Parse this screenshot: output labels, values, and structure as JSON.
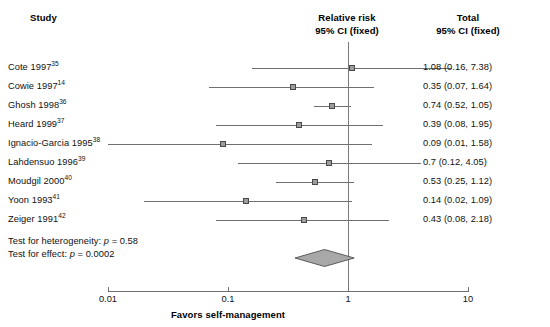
{
  "figure": {
    "type": "forest-plot",
    "headers": {
      "study": "Study",
      "center_line1": "Relative risk",
      "center_line2": "95% CI (fixed)",
      "total_line1": "Total",
      "total_line2": "95% CI (fixed)"
    },
    "axis": {
      "scale": "log",
      "ticks": [
        "0.01",
        "0.1",
        "1",
        "10"
      ],
      "tick_values": [
        0.01,
        0.1,
        1,
        10
      ],
      "null_value": 1,
      "title": "Favors self-management"
    },
    "tests": {
      "heterogeneity": "Test for heterogeneity: p = 0.58",
      "effect": "Test for effect: p = 0.0002"
    },
    "colors": {
      "line": "#6f6f6f",
      "box_fill": "#9c9c9c",
      "box_edge": "#4a4a4a",
      "diamond_fill": "#a8a8a8",
      "diamond_edge": "#5a5a5a",
      "text": "#111111",
      "background": "#ffffff"
    }
  },
  "chart_data": {
    "type": "forest",
    "title": "",
    "xlabel": "Favors self-management",
    "ylabel": "",
    "xscale": "log",
    "xlim": [
      0.01,
      10
    ],
    "xticks": [
      0.01,
      0.1,
      1,
      10
    ],
    "xticklabels": [
      "0.01",
      "0.1",
      "1",
      "10"
    ],
    "null_line": 1,
    "effect_measure": "Relative risk",
    "ci_level": "95% CI (fixed)",
    "grid": false,
    "legend": "none",
    "rows": [
      {
        "study": "Cote 1997",
        "ref": "35",
        "estimate": 1.08,
        "lower": 0.16,
        "upper": 7.38,
        "label": "1.08 (0.16, 7.38)"
      },
      {
        "study": "Cowie 1997",
        "ref": "14",
        "estimate": 0.35,
        "lower": 0.07,
        "upper": 1.64,
        "label": "0.35 (0.07, 1.64)"
      },
      {
        "study": "Ghosh 1998",
        "ref": "36",
        "estimate": 0.74,
        "lower": 0.52,
        "upper": 1.05,
        "label": "0.74 (0.52, 1.05)"
      },
      {
        "study": "Heard 1999",
        "ref": "37",
        "estimate": 0.39,
        "lower": 0.08,
        "upper": 1.95,
        "label": "0.39 (0.08, 1.95)"
      },
      {
        "study": "Ignacio-Garcia 1995",
        "ref": "38",
        "estimate": 0.09,
        "lower": 0.01,
        "upper": 1.58,
        "label": "0.09 (0.01, 1.58)"
      },
      {
        "study": "Lahdensuo 1996",
        "ref": "39",
        "estimate": 0.7,
        "lower": 0.12,
        "upper": 4.05,
        "label": "0.7 (0.12, 4.05)"
      },
      {
        "study": "Moudgil 2000",
        "ref": "40",
        "estimate": 0.53,
        "lower": 0.25,
        "upper": 1.12,
        "label": "0.53 (0.25, 1.12)"
      },
      {
        "study": "Yoon 1993",
        "ref": "41",
        "estimate": 0.14,
        "lower": 0.02,
        "upper": 1.09,
        "label": "0.14 (0.02, 1.09)"
      },
      {
        "study": "Zeiger 1991",
        "ref": "42",
        "estimate": 0.43,
        "lower": 0.08,
        "upper": 2.18,
        "label": "0.43 (0.08, 2.18)"
      }
    ],
    "summary": {
      "estimate": 0.64,
      "lower": 0.5,
      "upper": 0.81,
      "label": ""
    },
    "annotations": [
      "Test for heterogeneity: p = 0.58",
      "Test for effect: p = 0.0002"
    ]
  }
}
